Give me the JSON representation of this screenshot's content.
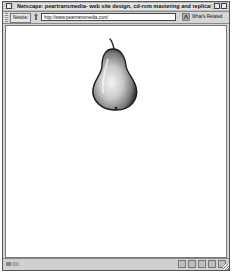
{
  "window": {
    "title": "Netscape: peartransmedia- web site design, cd-rom mastering and replicati..."
  },
  "location_bar": {
    "label": "Netsite:",
    "url": "http://www.peartransmedia.com/",
    "related_button": "What's Related"
  },
  "content": {
    "image_alt": "pear illustration"
  },
  "status_bar": {
    "text": "",
    "icons": [
      "security-icon",
      "component-icon",
      "mail-icon",
      "composer-icon",
      "discussion-icon"
    ]
  }
}
